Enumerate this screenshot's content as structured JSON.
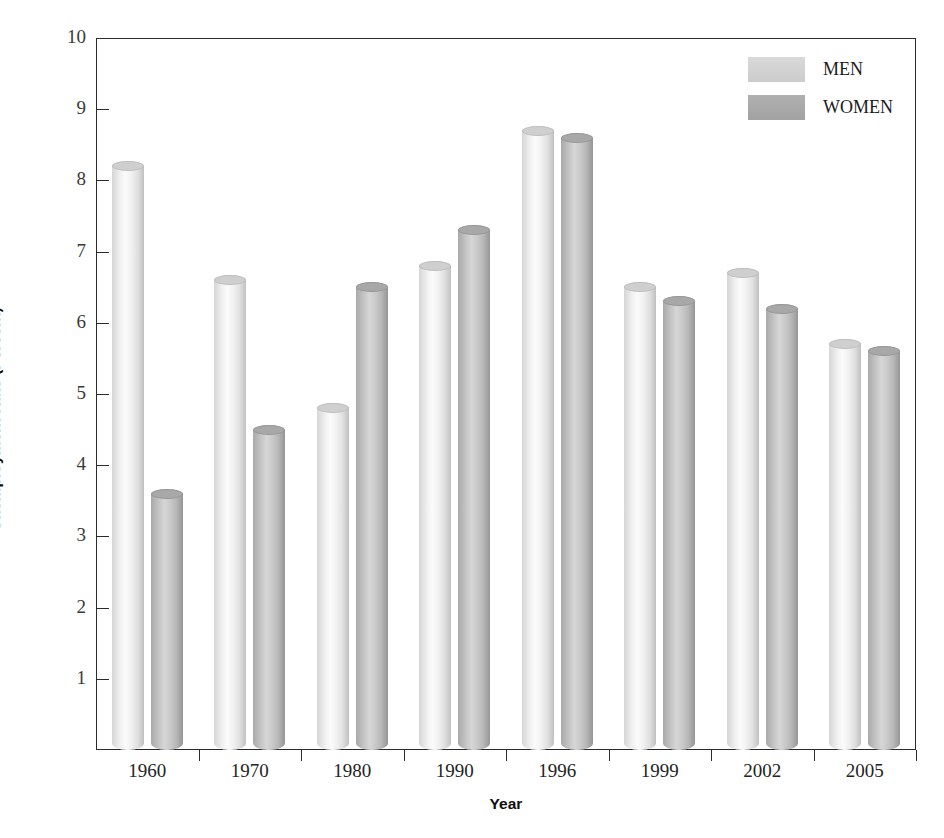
{
  "chart_data": {
    "type": "bar",
    "title": "",
    "xlabel": "Year",
    "ylabel": "Unemployment Rate (Percent)",
    "categories": [
      "1960",
      "1970",
      "1980",
      "1990",
      "1996",
      "1999",
      "2002",
      "2005"
    ],
    "series": [
      {
        "name": "MEN",
        "color": "#dcdcdc",
        "values": [
          8.2,
          6.6,
          4.8,
          6.8,
          8.7,
          6.5,
          6.7,
          5.7
        ]
      },
      {
        "name": "WOMEN",
        "color": "#aaaaaa",
        "values": [
          3.6,
          4.5,
          6.5,
          7.3,
          8.6,
          6.3,
          6.2,
          5.6
        ]
      }
    ],
    "ylim": [
      0,
      10
    ],
    "yticks": [
      1,
      2,
      3,
      4,
      5,
      6,
      7,
      8,
      9,
      10
    ],
    "ytick_labels": [
      "1",
      "2",
      "3",
      "4",
      "5",
      "6",
      "7",
      "8",
      "9",
      "10"
    ],
    "grid": false,
    "legend_position": "top-right",
    "bar_style": "cylinder-3d"
  },
  "axes": {
    "y_title": "Unemployment Rate (Percent)",
    "x_title": "Year"
  },
  "legend": {
    "entries": [
      {
        "label": "MEN"
      },
      {
        "label": "WOMEN"
      }
    ]
  }
}
